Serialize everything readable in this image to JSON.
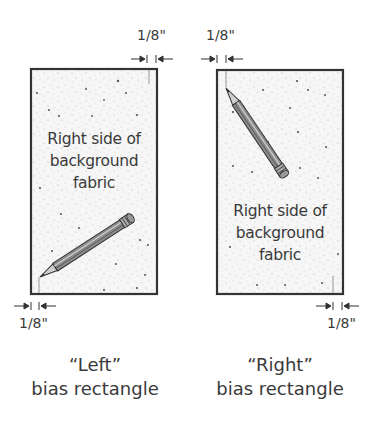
{
  "left_panel": {
    "fabric_label_lines": [
      "Right side of",
      "background",
      "fabric"
    ],
    "dimension_top": "",
    "dimension_bottom": "1/8\"",
    "caption_line1": "“Left”",
    "caption_line2": "bias rectangle"
  },
  "right_panel": {
    "fabric_label_lines": [
      "Right side of",
      "background",
      "fabric"
    ],
    "dimension_top": "1/8\"",
    "dimension_bottom": "1/8\"",
    "caption_line1": "“Right”",
    "caption_line2": "bias rectangle"
  },
  "left_top_dimension": "1/8\"",
  "colors": {
    "outline": "#333333",
    "fabric_fill": "#f4f4f4",
    "speckle": "#888888",
    "text": "#3a3a3a",
    "pencil_body": "#777777",
    "pencil_light": "#bbbbbb"
  }
}
